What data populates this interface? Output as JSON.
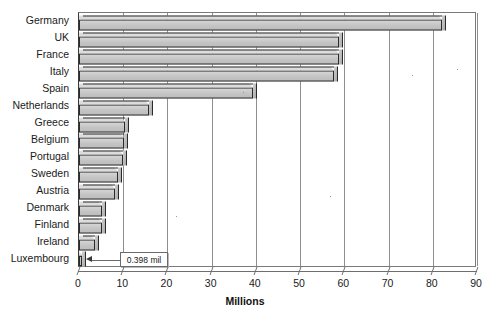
{
  "chart_data": {
    "type": "bar",
    "orientation": "horizontal",
    "title": "",
    "xlabel": "Millions",
    "ylabel": "",
    "xlim": [
      0,
      90
    ],
    "xticks": [
      "0",
      "10",
      "20",
      "30",
      "40",
      "50",
      "60",
      "70",
      "80",
      "90"
    ],
    "xtick_values": [
      0,
      10,
      20,
      30,
      40,
      50,
      60,
      70,
      80,
      90
    ],
    "grid": "vertical",
    "legend": "none",
    "categories": [
      "Germany",
      "UK",
      "France",
      "Italy",
      "Spain",
      "Netherlands",
      "Greece",
      "Belgium",
      "Portugal",
      "Sweden",
      "Austria",
      "Denmark",
      "Finland",
      "Ireland",
      "Luxembourg"
    ],
    "values": [
      82.0,
      58.8,
      58.8,
      57.6,
      39.4,
      15.8,
      10.5,
      10.2,
      9.9,
      8.9,
      8.1,
      5.3,
      5.2,
      3.7,
      0.398
    ],
    "bar_color": "#c9c9c9",
    "bar_edge_color": "#2b2b2b",
    "annotations": [
      {
        "label": "0.398 mil",
        "target_category": "Luxembourg",
        "target_value": 0.398
      }
    ]
  },
  "axis": {
    "x_title": "Millions"
  }
}
